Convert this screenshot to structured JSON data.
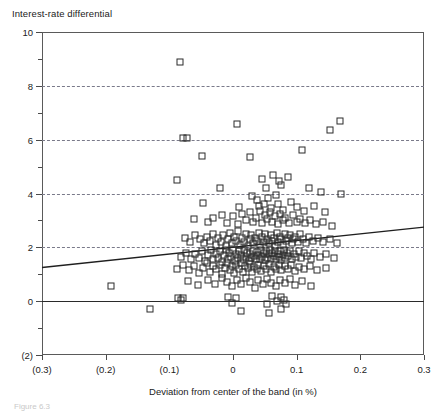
{
  "figure": {
    "caption": "Figure 6.3"
  },
  "chart_data": {
    "type": "scatter",
    "title": "Interest-rate differential",
    "xlabel": "Deviation from center of the band (in %)",
    "ylabel": "",
    "xlim": [
      -0.3,
      0.3
    ],
    "ylim": [
      -2,
      10
    ],
    "grid": true,
    "grid_axis": "y",
    "grid_style": "dashed",
    "legend": null,
    "marker": "open-square",
    "x_ticks": [
      -0.3,
      -0.2,
      -0.1,
      0,
      0.1,
      0.2,
      0.3
    ],
    "x_ticklabels": [
      "(0.3)",
      "(0.2)",
      "(0.1)",
      "0",
      "0.1",
      "0.2",
      "0.3"
    ],
    "y_ticks": [
      -2,
      0,
      2,
      4,
      6,
      8,
      10
    ],
    "y_ticklabels": [
      "(2)",
      "0",
      "2",
      "4",
      "6",
      "8",
      "10"
    ],
    "y_minor_ticks": [
      -1,
      1,
      3,
      5,
      7,
      9
    ],
    "gridlines_y": [
      2,
      4,
      6,
      8
    ],
    "zero_line_y": 0,
    "series": [
      {
        "name": "observations",
        "points": [
          [
            -0.084,
            8.9
          ],
          [
            -0.079,
            6.05
          ],
          [
            -0.073,
            6.05
          ],
          [
            0.006,
            6.6
          ],
          [
            0.152,
            6.35
          ],
          [
            0.168,
            6.7
          ],
          [
            -0.049,
            5.4
          ],
          [
            0.027,
            5.35
          ],
          [
            0.108,
            5.6
          ],
          [
            -0.088,
            4.5
          ],
          [
            -0.021,
            4.2
          ],
          [
            0.046,
            4.55
          ],
          [
            0.052,
            4.2
          ],
          [
            0.063,
            4.7
          ],
          [
            0.072,
            4.45
          ],
          [
            0.076,
            4.3
          ],
          [
            0.086,
            4.6
          ],
          [
            0.119,
            4.2
          ],
          [
            0.138,
            4.05
          ],
          [
            0.17,
            4.0
          ],
          [
            -0.047,
            3.65
          ],
          [
            0.009,
            3.5
          ],
          [
            0.03,
            3.9
          ],
          [
            0.038,
            3.75
          ],
          [
            0.041,
            3.55
          ],
          [
            0.048,
            3.6
          ],
          [
            0.055,
            3.85
          ],
          [
            0.06,
            3.45
          ],
          [
            0.068,
            3.95
          ],
          [
            0.071,
            3.6
          ],
          [
            0.079,
            3.4
          ],
          [
            0.091,
            3.7
          ],
          [
            0.1,
            3.5
          ],
          [
            0.112,
            3.35
          ],
          [
            0.127,
            3.55
          ],
          [
            0.145,
            3.3
          ],
          [
            -0.062,
            3.05
          ],
          [
            -0.04,
            2.95
          ],
          [
            -0.031,
            3.1
          ],
          [
            -0.018,
            3.2
          ],
          [
            -0.01,
            2.9
          ],
          [
            0.0,
            3.15
          ],
          [
            0.008,
            2.85
          ],
          [
            0.014,
            3.25
          ],
          [
            0.021,
            3.0
          ],
          [
            0.026,
            3.3
          ],
          [
            0.031,
            2.95
          ],
          [
            0.036,
            3.1
          ],
          [
            0.042,
            3.35
          ],
          [
            0.046,
            2.9
          ],
          [
            0.05,
            3.2
          ],
          [
            0.054,
            3.05
          ],
          [
            0.058,
            3.3
          ],
          [
            0.062,
            2.95
          ],
          [
            0.066,
            3.15
          ],
          [
            0.07,
            2.85
          ],
          [
            0.074,
            3.25
          ],
          [
            0.078,
            3.0
          ],
          [
            0.082,
            3.1
          ],
          [
            0.088,
            2.9
          ],
          [
            0.094,
            3.2
          ],
          [
            0.1,
            2.95
          ],
          [
            0.106,
            3.05
          ],
          [
            0.113,
            2.9
          ],
          [
            0.121,
            3.0
          ],
          [
            0.13,
            2.85
          ],
          [
            0.141,
            2.95
          ],
          [
            0.156,
            2.8
          ],
          [
            -0.075,
            2.35
          ],
          [
            -0.068,
            2.2
          ],
          [
            -0.059,
            2.45
          ],
          [
            -0.052,
            2.3
          ],
          [
            -0.046,
            2.15
          ],
          [
            -0.041,
            2.4
          ],
          [
            -0.036,
            2.25
          ],
          [
            -0.031,
            2.5
          ],
          [
            -0.027,
            2.1
          ],
          [
            -0.023,
            2.35
          ],
          [
            -0.019,
            2.2
          ],
          [
            -0.015,
            2.45
          ],
          [
            -0.011,
            2.05
          ],
          [
            -0.008,
            2.3
          ],
          [
            -0.004,
            2.55
          ],
          [
            -0.001,
            2.15
          ],
          [
            0.002,
            2.4
          ],
          [
            0.005,
            2.25
          ],
          [
            0.008,
            2.6
          ],
          [
            0.011,
            2.1
          ],
          [
            0.014,
            2.35
          ],
          [
            0.017,
            2.2
          ],
          [
            0.02,
            2.5
          ],
          [
            0.023,
            2.05
          ],
          [
            0.026,
            2.3
          ],
          [
            0.029,
            2.45
          ],
          [
            0.032,
            2.15
          ],
          [
            0.035,
            2.35
          ],
          [
            0.038,
            2.25
          ],
          [
            0.041,
            2.55
          ],
          [
            0.043,
            2.1
          ],
          [
            0.046,
            2.4
          ],
          [
            0.049,
            2.2
          ],
          [
            0.051,
            2.5
          ],
          [
            0.054,
            2.3
          ],
          [
            0.056,
            2.15
          ],
          [
            0.059,
            2.45
          ],
          [
            0.061,
            2.25
          ],
          [
            0.064,
            2.35
          ],
          [
            0.066,
            2.05
          ],
          [
            0.069,
            2.55
          ],
          [
            0.071,
            2.2
          ],
          [
            0.074,
            2.4
          ],
          [
            0.076,
            2.3
          ],
          [
            0.079,
            2.1
          ],
          [
            0.081,
            2.5
          ],
          [
            0.084,
            2.25
          ],
          [
            0.086,
            2.35
          ],
          [
            0.089,
            2.45
          ],
          [
            0.092,
            2.15
          ],
          [
            0.095,
            2.3
          ],
          [
            0.098,
            2.4
          ],
          [
            0.102,
            2.2
          ],
          [
            0.106,
            2.5
          ],
          [
            0.11,
            2.3
          ],
          [
            0.115,
            2.15
          ],
          [
            0.12,
            2.4
          ],
          [
            0.126,
            2.25
          ],
          [
            0.133,
            2.35
          ],
          [
            0.142,
            2.2
          ],
          [
            0.152,
            2.3
          ],
          [
            0.163,
            2.15
          ],
          [
            -0.082,
            1.65
          ],
          [
            -0.074,
            1.8
          ],
          [
            -0.066,
            1.55
          ],
          [
            -0.06,
            1.75
          ],
          [
            -0.054,
            1.6
          ],
          [
            -0.049,
            1.85
          ],
          [
            -0.044,
            1.5
          ],
          [
            -0.039,
            1.7
          ],
          [
            -0.035,
            1.9
          ],
          [
            -0.031,
            1.55
          ],
          [
            -0.027,
            1.75
          ],
          [
            -0.024,
            1.6
          ],
          [
            -0.02,
            1.85
          ],
          [
            -0.017,
            1.45
          ],
          [
            -0.014,
            1.7
          ],
          [
            -0.011,
            1.9
          ],
          [
            -0.008,
            1.55
          ],
          [
            -0.006,
            1.8
          ],
          [
            -0.003,
            1.65
          ],
          [
            0.0,
            1.9
          ],
          [
            0.003,
            1.5
          ],
          [
            0.005,
            1.75
          ],
          [
            0.008,
            1.6
          ],
          [
            0.01,
            1.85
          ],
          [
            0.013,
            1.7
          ],
          [
            0.015,
            1.55
          ],
          [
            0.018,
            1.9
          ],
          [
            0.02,
            1.65
          ],
          [
            0.022,
            1.8
          ],
          [
            0.025,
            1.5
          ],
          [
            0.027,
            1.75
          ],
          [
            0.029,
            1.6
          ],
          [
            0.031,
            1.88
          ],
          [
            0.033,
            1.68
          ],
          [
            0.036,
            1.55
          ],
          [
            0.038,
            1.82
          ],
          [
            0.04,
            1.7
          ],
          [
            0.042,
            1.58
          ],
          [
            0.044,
            1.9
          ],
          [
            0.046,
            1.65
          ],
          [
            0.048,
            1.78
          ],
          [
            0.05,
            1.52
          ],
          [
            0.052,
            1.85
          ],
          [
            0.054,
            1.62
          ],
          [
            0.056,
            1.74
          ],
          [
            0.058,
            1.9
          ],
          [
            0.06,
            1.56
          ],
          [
            0.062,
            1.8
          ],
          [
            0.064,
            1.66
          ],
          [
            0.066,
            1.88
          ],
          [
            0.068,
            1.58
          ],
          [
            0.07,
            1.76
          ],
          [
            0.072,
            1.64
          ],
          [
            0.074,
            1.86
          ],
          [
            0.076,
            1.54
          ],
          [
            0.078,
            1.72
          ],
          [
            0.08,
            1.9
          ],
          [
            0.082,
            1.6
          ],
          [
            0.085,
            1.8
          ],
          [
            0.087,
            1.68
          ],
          [
            0.09,
            1.85
          ],
          [
            0.093,
            1.58
          ],
          [
            0.096,
            1.75
          ],
          [
            0.099,
            1.65
          ],
          [
            0.103,
            1.85
          ],
          [
            0.107,
            1.6
          ],
          [
            0.111,
            1.78
          ],
          [
            0.116,
            1.68
          ],
          [
            0.122,
            1.55
          ],
          [
            0.128,
            1.8
          ],
          [
            0.136,
            1.65
          ],
          [
            0.146,
            1.75
          ],
          [
            0.158,
            1.6
          ],
          [
            -0.088,
            1.2
          ],
          [
            -0.078,
            1.35
          ],
          [
            -0.069,
            1.15
          ],
          [
            -0.061,
            1.3
          ],
          [
            -0.054,
            1.05
          ],
          [
            -0.047,
            1.25
          ],
          [
            -0.041,
            1.4
          ],
          [
            -0.036,
            1.1
          ],
          [
            -0.031,
            1.3
          ],
          [
            -0.026,
            1.2
          ],
          [
            -0.021,
            1.35
          ],
          [
            -0.017,
            1.0
          ],
          [
            -0.013,
            1.25
          ],
          [
            -0.009,
            1.4
          ],
          [
            -0.005,
            1.15
          ],
          [
            -0.002,
            1.3
          ],
          [
            0.002,
            1.05
          ],
          [
            0.005,
            1.35
          ],
          [
            0.009,
            1.2
          ],
          [
            0.012,
            1.4
          ],
          [
            0.016,
            1.1
          ],
          [
            0.019,
            1.3
          ],
          [
            0.023,
            1.22
          ],
          [
            0.026,
            1.38
          ],
          [
            0.03,
            1.08
          ],
          [
            0.033,
            1.28
          ],
          [
            0.037,
            1.18
          ],
          [
            0.04,
            1.35
          ],
          [
            0.044,
            1.12
          ],
          [
            0.048,
            1.3
          ],
          [
            0.052,
            1.2
          ],
          [
            0.056,
            1.38
          ],
          [
            0.06,
            1.1
          ],
          [
            0.064,
            1.28
          ],
          [
            0.068,
            1.18
          ],
          [
            0.072,
            1.34
          ],
          [
            0.076,
            1.14
          ],
          [
            0.081,
            1.3
          ],
          [
            0.086,
            1.2
          ],
          [
            0.091,
            1.36
          ],
          [
            0.097,
            1.12
          ],
          [
            0.104,
            1.28
          ],
          [
            0.112,
            1.18
          ],
          [
            0.121,
            1.32
          ],
          [
            0.132,
            1.15
          ],
          [
            0.146,
            1.25
          ],
          [
            -0.07,
            0.75
          ],
          [
            -0.055,
            0.6
          ],
          [
            -0.04,
            0.8
          ],
          [
            -0.028,
            0.65
          ],
          [
            -0.018,
            0.85
          ],
          [
            -0.009,
            0.7
          ],
          [
            -0.001,
            0.55
          ],
          [
            0.006,
            0.8
          ],
          [
            0.013,
            0.65
          ],
          [
            0.02,
            0.85
          ],
          [
            0.027,
            0.7
          ],
          [
            0.034,
            0.5
          ],
          [
            0.04,
            0.78
          ],
          [
            0.047,
            0.62
          ],
          [
            0.054,
            0.84
          ],
          [
            0.06,
            0.68
          ],
          [
            0.067,
            0.55
          ],
          [
            0.074,
            0.8
          ],
          [
            0.081,
            0.66
          ],
          [
            0.089,
            0.82
          ],
          [
            0.098,
            0.6
          ],
          [
            0.109,
            0.75
          ],
          [
            0.122,
            0.58
          ],
          [
            -0.191,
            0.55
          ],
          [
            -0.086,
            0.1
          ],
          [
            -0.082,
            0.05
          ],
          [
            -0.079,
            0.12
          ],
          [
            -0.008,
            0.15
          ],
          [
            -0.001,
            -0.05
          ],
          [
            0.005,
            0.1
          ],
          [
            0.062,
            0.2
          ],
          [
            0.069,
            0.02
          ],
          [
            0.075,
            0.15
          ],
          [
            0.08,
            0.05
          ],
          [
            0.013,
            -0.35
          ],
          [
            0.053,
            -0.1
          ],
          [
            0.057,
            -0.45
          ],
          [
            -0.131,
            -0.28
          ],
          [
            0.076,
            -0.3
          ],
          [
            0.083,
            -0.12
          ]
        ]
      }
    ],
    "fit_line": {
      "name": "regression-line",
      "x_start": -0.3,
      "y_start": 1.25,
      "x_end": 0.3,
      "y_end": 2.75
    }
  }
}
